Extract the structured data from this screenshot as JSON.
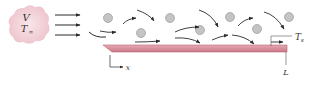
{
  "diagram": {
    "freestream": {
      "velocity_label": "V",
      "temperature_label": "T",
      "temperature_subscript": "∞"
    },
    "plate": {
      "surface_temp_label": "T",
      "surface_temp_subscript": "s",
      "length_label": "L",
      "axis_label": "x"
    },
    "colors": {
      "cloud": "#f3d3da",
      "plate": "#d98d9b",
      "plate_edge": "#b56575",
      "particle": "#c4c4c4",
      "arrow": "#2a2a2a"
    },
    "particles": [
      {
        "cx": 108,
        "cy": 18
      },
      {
        "cx": 170,
        "cy": 18
      },
      {
        "cx": 230,
        "cy": 17
      },
      {
        "cx": 289,
        "cy": 17
      },
      {
        "cx": 141,
        "cy": 33
      },
      {
        "cx": 200,
        "cy": 30
      },
      {
        "cx": 257,
        "cy": 29
      }
    ]
  }
}
